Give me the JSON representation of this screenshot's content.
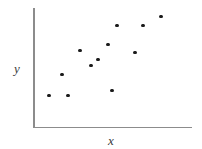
{
  "chart_data": {
    "type": "scatter",
    "title": "",
    "subtitle": "",
    "xlabel": "x",
    "ylabel": "y",
    "xlim": [
      0,
      1
    ],
    "ylim": [
      0,
      1
    ],
    "grid": false,
    "legend": false,
    "axis_ticks": false,
    "tick_labels": [],
    "annotations": [],
    "marker": {
      "shape": "circle",
      "color": "#1a1a1a",
      "size_px": 3.4
    },
    "axis_color": "#8c8c8c",
    "background_color": "#ffffff",
    "n_points": 12,
    "relationship": "positive",
    "series": [
      {
        "name": "observations",
        "points": [
          {
            "x": 0.101,
            "y": 0.271,
            "px": 49.0,
            "py": 93.0
          },
          {
            "x": 0.22,
            "y": 0.271,
            "px": 68.0,
            "py": 93.0
          },
          {
            "x": 0.182,
            "y": 0.446,
            "px": 62.0,
            "py": 72.0
          },
          {
            "x": 0.296,
            "y": 0.646,
            "px": 80.0,
            "py": 48.0
          },
          {
            "x": 0.409,
            "y": 0.571,
            "px": 98.0,
            "py": 57.0
          },
          {
            "x": 0.472,
            "y": 0.696,
            "px": 108.0,
            "py": 42.0
          },
          {
            "x": 0.497,
            "y": 0.313,
            "px": 112.0,
            "py": 88.0
          },
          {
            "x": 0.528,
            "y": 0.854,
            "px": 117.0,
            "py": 23.0
          },
          {
            "x": 0.642,
            "y": 0.629,
            "px": 135.0,
            "py": 50.0
          },
          {
            "x": 0.692,
            "y": 0.854,
            "px": 143.0,
            "py": 23.0
          },
          {
            "x": 0.805,
            "y": 0.929,
            "px": 161.0,
            "py": 14.0
          },
          {
            "x": 0.365,
            "y": 0.521,
            "px": 91.0,
            "py": 63.0
          }
        ]
      }
    ]
  },
  "figure": {
    "width_px": 202,
    "height_px": 149
  }
}
